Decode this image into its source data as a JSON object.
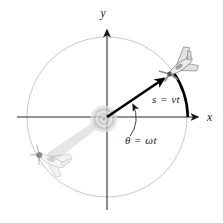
{
  "figure": {
    "description_labels": {
      "x_axis": "x",
      "y_axis": "y",
      "arc_length": "s = vt",
      "angle": "θ = ωt"
    },
    "icons": {
      "airplane_current": "model-airplane-icon",
      "airplane_ghost": "model-airplane-ghost-icon",
      "pivot_hub": "pivot-hub-icon"
    },
    "colors": {
      "axis": "#2b2b2b",
      "circle_path": "#c9c9c9",
      "radius_vector": "#000000",
      "arc_swept": "#000000",
      "angle_arrow": "#2b2b2b",
      "guideline_arm": "#e6e6e6",
      "hub_ring": "#c4c4c4",
      "plane_body": "#ececec"
    }
  }
}
